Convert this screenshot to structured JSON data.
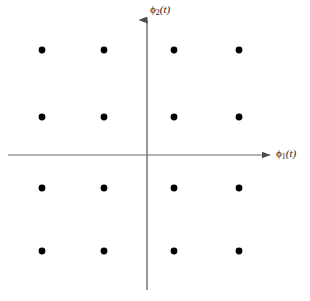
{
  "figure": {
    "title": "",
    "background_color": "#ffffff",
    "width": 310,
    "height": 301
  },
  "axes": {
    "x": {
      "label_symbol": "ϕ",
      "label_subscript": "1",
      "label_arg": "(t)",
      "label_text": "ϕ1(t)",
      "color": "#6b6b6b",
      "origin_px": 155,
      "start_px": 8,
      "end_px": 270,
      "arrow": "right"
    },
    "y": {
      "label_symbol": "ϕ",
      "label_subscript": "2",
      "label_arg": "(t)",
      "label_text": "ϕ2(t)",
      "color": "#6b6b6b",
      "origin_px": 147,
      "start_px": 290,
      "end_px": 20,
      "arrow": "up"
    }
  },
  "chart_data": {
    "type": "scatter",
    "title": "",
    "xlabel": "ϕ1(t)",
    "ylabel": "ϕ2(t)",
    "grid": false,
    "legend": null,
    "axis_ticks": {
      "x": [],
      "y": []
    },
    "xlim": [
      -3,
      3
    ],
    "ylim": [
      -3,
      3
    ],
    "marker": {
      "shape": "circle",
      "color": "#000000",
      "radius_px": 3.4
    },
    "series": [
      {
        "name": "16-QAM constellation points",
        "color": "#000000",
        "points": [
          {
            "x": -3,
            "y": 3,
            "px": 42,
            "py": 50
          },
          {
            "x": -1,
            "y": 3,
            "px": 104,
            "py": 50
          },
          {
            "x": 1,
            "y": 3,
            "px": 174,
            "py": 50
          },
          {
            "x": 3,
            "y": 3,
            "px": 239,
            "py": 50
          },
          {
            "x": -3,
            "y": 1,
            "px": 42,
            "py": 117
          },
          {
            "x": -1,
            "y": 1,
            "px": 104,
            "py": 117
          },
          {
            "x": 1,
            "y": 1,
            "px": 174,
            "py": 117
          },
          {
            "x": 3,
            "y": 1,
            "px": 239,
            "py": 117
          },
          {
            "x": -3,
            "y": -1,
            "px": 42,
            "py": 188
          },
          {
            "x": -1,
            "y": -1,
            "px": 104,
            "py": 188
          },
          {
            "x": 1,
            "y": -1,
            "px": 174,
            "py": 188
          },
          {
            "x": 3,
            "y": -1,
            "px": 239,
            "py": 188
          },
          {
            "x": -3,
            "y": -3,
            "px": 42,
            "py": 251
          },
          {
            "x": -1,
            "y": -3,
            "px": 104,
            "py": 251
          },
          {
            "x": 1,
            "y": -3,
            "px": 174,
            "py": 251
          },
          {
            "x": 3,
            "y": -3,
            "px": 239,
            "py": 251
          }
        ]
      }
    ]
  }
}
